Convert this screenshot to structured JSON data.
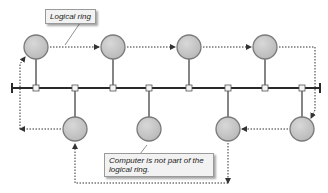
{
  "diagram": {
    "callouts": {
      "logical_ring": "Logical ring",
      "not_part": "Computer is not part of the logical ring."
    },
    "colors": {
      "node_fill": "#c8c8c8",
      "node_stroke": "#7a7a7a",
      "bus": "#2a2a2a",
      "dotted_arrow": "#333333",
      "callout_bg": "#f2f2f2"
    },
    "bus": {
      "y": 88,
      "x_start": 12,
      "x_end": 320
    },
    "top_nodes": [
      {
        "id": "A",
        "x": 36,
        "y": 47,
        "in_ring": true
      },
      {
        "id": "B",
        "x": 113,
        "y": 47,
        "in_ring": true
      },
      {
        "id": "C",
        "x": 189,
        "y": 47,
        "in_ring": true
      },
      {
        "id": "D",
        "x": 265,
        "y": 47,
        "in_ring": true
      }
    ],
    "bottom_nodes": [
      {
        "id": "H",
        "x": 75,
        "y": 129,
        "in_ring": true
      },
      {
        "id": "G",
        "x": 149,
        "y": 129,
        "in_ring": false
      },
      {
        "id": "F",
        "x": 228,
        "y": 129,
        "in_ring": true
      },
      {
        "id": "E",
        "x": 302,
        "y": 129,
        "in_ring": true
      }
    ],
    "ring_order": [
      "A",
      "B",
      "C",
      "D",
      "E",
      "F",
      "H",
      "A"
    ]
  }
}
